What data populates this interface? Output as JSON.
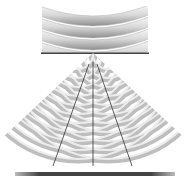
{
  "diagram": {
    "type": "double-slit-interference",
    "incident_wavefronts": 4,
    "slits": 2,
    "diffracted_rings_per_slit": 12,
    "interference_lines": 3,
    "colors": {
      "wave_light": "#ffffff",
      "wave_dark": "#9a9a9a",
      "barrier": "#444444",
      "screen": "#555555",
      "lines": "#333333"
    }
  }
}
